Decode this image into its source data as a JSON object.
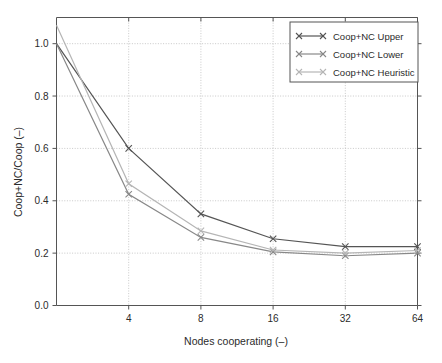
{
  "chart_data": {
    "type": "line",
    "title": "",
    "xlabel": "Nodes cooperating (–)",
    "ylabel": "Coop+NC/Coop (–)",
    "x": [
      2,
      4,
      8,
      16,
      32,
      64
    ],
    "xticks": [
      4,
      8,
      16,
      32,
      64
    ],
    "xtick_labels": [
      "4",
      "8",
      "16",
      "32",
      "64"
    ],
    "xscale": "log2",
    "xlim": [
      2,
      64
    ],
    "yticks": [
      0.0,
      0.2,
      0.4,
      0.6,
      0.8,
      1.0
    ],
    "ytick_labels": [
      "0.0",
      "0.2",
      "0.4",
      "0.6",
      "0.8",
      "1.0"
    ],
    "ylim": [
      0.0,
      1.1
    ],
    "grid": true,
    "grid_style": "dotted",
    "legend_position": "top-right",
    "series": [
      {
        "name": "Coop+NC Upper",
        "color": "#555555",
        "marker": "x",
        "values": [
          1.0,
          0.6,
          0.35,
          0.255,
          0.225,
          0.225
        ]
      },
      {
        "name": "Coop+NC Lower",
        "color": "#888888",
        "marker": "x",
        "values": [
          1.0,
          0.425,
          0.26,
          0.205,
          0.19,
          0.2
        ]
      },
      {
        "name": "Coop+NC Heuristic",
        "color": "#b5b5b5",
        "marker": "x",
        "values": [
          1.07,
          0.465,
          0.285,
          0.212,
          0.2,
          0.21
        ]
      }
    ]
  },
  "legend": {
    "entries": [
      {
        "label": "Coop+NC Upper"
      },
      {
        "label": "Coop+NC Lower"
      },
      {
        "label": "Coop+NC Heuristic"
      }
    ]
  },
  "axes": {
    "x_label": "Nodes cooperating (–)",
    "y_label": "Coop+NC/Coop (–)",
    "x_tick_labels": [
      "4",
      "8",
      "16",
      "32",
      "64"
    ],
    "y_tick_labels": [
      "0.0",
      "0.2",
      "0.4",
      "0.6",
      "0.8",
      "1.0"
    ]
  },
  "colors": {
    "upper": "#555555",
    "lower": "#888888",
    "heuristic": "#b5b5b5",
    "axis": "#555555",
    "grid": "#bbbbbb",
    "background": "#ffffff"
  }
}
